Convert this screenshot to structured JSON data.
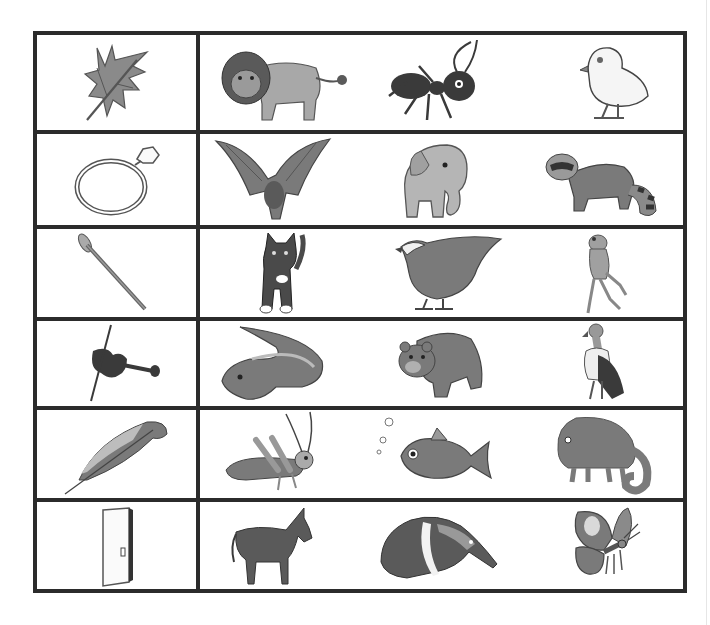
{
  "worksheet": {
    "rows": [
      {
        "object": "leaf",
        "animals": [
          "lion",
          "ant",
          "chick"
        ]
      },
      {
        "object": "ring",
        "animals": [
          "bat",
          "elephant",
          "raccoon"
        ]
      },
      {
        "object": "nail",
        "animals": [
          "cat",
          "bird",
          "frog"
        ]
      },
      {
        "object": "violin",
        "animals": [
          "eel",
          "bear",
          "vulture"
        ]
      },
      {
        "object": "feather",
        "animals": [
          "grasshopper",
          "fish",
          "chameleon"
        ]
      },
      {
        "object": "door",
        "animals": [
          "donkey",
          "anteater",
          "butterfly"
        ]
      }
    ]
  },
  "colors": {
    "border": "#2b2b2b",
    "fill_dark": "#4a4a4a",
    "fill_mid": "#7a7a7a",
    "fill_light": "#a8a8a8",
    "fill_pale": "#d9d9d9",
    "background": "#ffffff"
  }
}
